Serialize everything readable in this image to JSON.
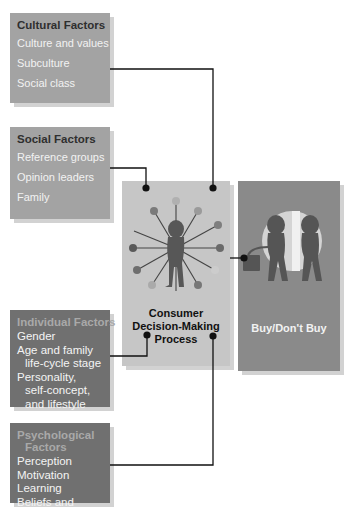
{
  "cultural": {
    "title": "Cultural Factors",
    "items": [
      "Culture and values",
      "Subculture",
      "Social class"
    ]
  },
  "social": {
    "title": "Social Factors",
    "items": [
      "Reference groups",
      "Opinion leaders",
      "Family"
    ]
  },
  "individual": {
    "title": "Individual Factors",
    "items": [
      "Gender",
      "Age and family",
      "life-cycle stage",
      "Personality,",
      "self-concept,",
      "and lifestyle"
    ]
  },
  "psychological": {
    "title_line1": "Psychological",
    "title_line2": "Factors",
    "items": [
      "Perception",
      "Motivation",
      "Learning",
      "Beliefs and"
    ]
  },
  "center": {
    "label_line1": "Consumer",
    "label_line2": "Decision-Making",
    "label_line3": "Process",
    "icon": "consumer-hub-icon"
  },
  "outcome": {
    "label": "Buy/Don't Buy",
    "icon": "shoppers-silhouette-icon"
  },
  "colors": {
    "light_box": "#a3a3a3",
    "dark_box": "#707070",
    "center_box": "#c6c6c6",
    "outcome_box": "#8a8a8a",
    "connector": "#111111"
  }
}
